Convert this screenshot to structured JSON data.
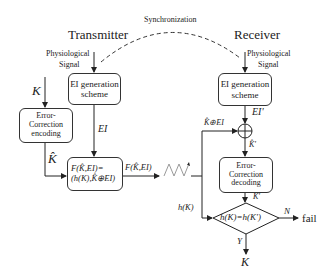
{
  "title": {
    "transmitter": "Transmitter",
    "receiver": "Receiver",
    "sync": "Synchronization"
  },
  "inputs": {
    "tx_signal_1": "Physiological",
    "tx_signal_2": "Signal",
    "rx_signal_1": "Physiological",
    "rx_signal_2": "Signal",
    "key": "K"
  },
  "boxes": {
    "tx_ei_1": "EI generation",
    "tx_ei_2": "scheme",
    "ec_enc_1": "Error-",
    "ec_enc_2": "Correction",
    "ec_enc_3": "encoding",
    "f_1": "F(K̂,EI)=",
    "f_2": "(h(K),K̂⊕EI)",
    "rx_ei_1": "EI generation",
    "rx_ei_2": "scheme",
    "ec_dec_1": "Error-",
    "ec_dec_2": "Correction",
    "ec_dec_3": "decoding",
    "decision": "h(K)=h(K')"
  },
  "edges": {
    "ei": "EI",
    "khat": "K̂",
    "f_out": "F(K̂,EI)",
    "ei_prime": "EI'",
    "khat_xor_ei": "K̂⊕EI",
    "khat_prime": "K̂'",
    "k_prime": "K'",
    "hk": "h(K)",
    "no": "N",
    "yes": "Y",
    "fail": "fail",
    "out_key": "K"
  }
}
